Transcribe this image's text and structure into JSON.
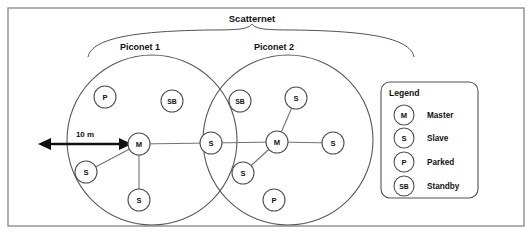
{
  "figure": {
    "title": "Scatternet",
    "dimension_label": "10 m",
    "background_color": "#ffffff",
    "frame_color": "#8d8d8d",
    "node_stroke_color": "#4d5153",
    "link_color": "#6e7274",
    "arrow_color": "#111111"
  },
  "piconets": [
    {
      "label": "Piconet 1",
      "nodes": [
        {
          "id": "p1-parked",
          "code": "P",
          "role": "Parked"
        },
        {
          "id": "p1-standby",
          "code": "SB",
          "role": "Standby"
        },
        {
          "id": "p1-master",
          "code": "M",
          "role": "Master"
        },
        {
          "id": "p1-slave-left",
          "code": "S",
          "role": "Slave"
        },
        {
          "id": "p1-slave-bottom",
          "code": "S",
          "role": "Slave"
        }
      ]
    },
    {
      "label": "Piconet 2",
      "nodes": [
        {
          "id": "p2-standby",
          "code": "SB",
          "role": "Standby"
        },
        {
          "id": "p2-slave-top",
          "code": "S",
          "role": "Slave"
        },
        {
          "id": "p2-master",
          "code": "M",
          "role": "Master"
        },
        {
          "id": "p2-slave-right",
          "code": "S",
          "role": "Slave"
        },
        {
          "id": "p2-slave-lower-left",
          "code": "S",
          "role": "Slave"
        },
        {
          "id": "p2-parked",
          "code": "P",
          "role": "Parked"
        }
      ]
    }
  ],
  "bridge_node": {
    "id": "bridge-slave",
    "code": "S",
    "role": "Slave"
  },
  "legend": {
    "title": "Legend",
    "entries": [
      {
        "code": "M",
        "label": "Master"
      },
      {
        "code": "S",
        "label": "Slave"
      },
      {
        "code": "P",
        "label": "Parked"
      },
      {
        "code": "SB",
        "label": "Standby"
      }
    ]
  }
}
